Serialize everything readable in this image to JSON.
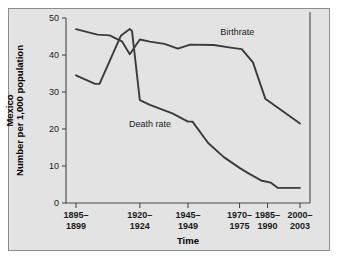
{
  "figure": {
    "background_color": "#e3e3e3",
    "frame_color": "#8d8d8d",
    "line_color": "#3b3b3b"
  },
  "chart_data": {
    "type": "line",
    "title": "",
    "subtitle": "",
    "xlabel": "Time",
    "ylabel": "Number per 1,000 population",
    "ylabel_prefix": "Mexico",
    "ylim": [
      0,
      50
    ],
    "yticks": [
      0,
      10,
      20,
      30,
      40,
      50
    ],
    "ytick_labels": [
      "0",
      "10",
      "20",
      "30",
      "40",
      "50"
    ],
    "grid": false,
    "legend_position": "inline-annotation",
    "categories": [
      "1895-1899",
      "1920-1924",
      "1945-1949",
      "1970-1975",
      "1985-1990",
      "2000-2003"
    ],
    "xtick_labels_top": [
      "1895–",
      "1920–",
      "1945–",
      "1970–",
      "1985–",
      "2000–"
    ],
    "xtick_labels_bottom": [
      "1899",
      "1924",
      "1949",
      "1975",
      "1990",
      "2003"
    ],
    "annotations": [
      {
        "text": "Birthrate",
        "x_frac": 0.72,
        "y_value": 45.5
      },
      {
        "text": "Death rate",
        "x_frac": 0.33,
        "y_value": 20.5
      }
    ],
    "series": [
      {
        "name": "Birthrate",
        "points": [
          {
            "x_frac": 0.0,
            "y": 47.0
          },
          {
            "x_frac": 0.095,
            "y": 45.5
          },
          {
            "x_frac": 0.15,
            "y": 45.3
          },
          {
            "x_frac": 0.205,
            "y": 43.7
          },
          {
            "x_frac": 0.24,
            "y": 40.2
          },
          {
            "x_frac": 0.285,
            "y": 44.2
          },
          {
            "x_frac": 0.33,
            "y": 43.6
          },
          {
            "x_frac": 0.395,
            "y": 43.0
          },
          {
            "x_frac": 0.455,
            "y": 41.7
          },
          {
            "x_frac": 0.51,
            "y": 42.8
          },
          {
            "x_frac": 0.615,
            "y": 42.7
          },
          {
            "x_frac": 0.69,
            "y": 42.0
          },
          {
            "x_frac": 0.74,
            "y": 41.6
          },
          {
            "x_frac": 0.79,
            "y": 38.0
          },
          {
            "x_frac": 0.845,
            "y": 28.2
          },
          {
            "x_frac": 1.0,
            "y": 21.5
          }
        ]
      },
      {
        "name": "Death rate",
        "points": [
          {
            "x_frac": 0.0,
            "y": 34.5
          },
          {
            "x_frac": 0.085,
            "y": 32.2
          },
          {
            "x_frac": 0.105,
            "y": 32.2
          },
          {
            "x_frac": 0.2,
            "y": 45.2
          },
          {
            "x_frac": 0.24,
            "y": 47.0
          },
          {
            "x_frac": 0.25,
            "y": 46.5
          },
          {
            "x_frac": 0.285,
            "y": 27.8
          },
          {
            "x_frac": 0.33,
            "y": 26.5
          },
          {
            "x_frac": 0.43,
            "y": 24.2
          },
          {
            "x_frac": 0.5,
            "y": 22.0
          },
          {
            "x_frac": 0.52,
            "y": 22.0
          },
          {
            "x_frac": 0.59,
            "y": 16.2
          },
          {
            "x_frac": 0.66,
            "y": 12.4
          },
          {
            "x_frac": 0.73,
            "y": 9.5
          },
          {
            "x_frac": 0.77,
            "y": 8.0
          },
          {
            "x_frac": 0.83,
            "y": 6.0
          },
          {
            "x_frac": 0.87,
            "y": 5.5
          },
          {
            "x_frac": 0.9,
            "y": 4.1
          },
          {
            "x_frac": 1.0,
            "y": 4.1
          }
        ]
      }
    ]
  }
}
